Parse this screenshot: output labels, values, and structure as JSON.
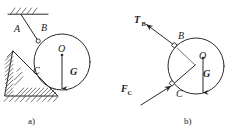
{
  "figure": {
    "stroke_color": "#2a2a2a",
    "hatch_color": "#3a3a3a",
    "background": "#ffffff"
  },
  "panel_a": {
    "caption": "a)",
    "labels": {
      "rod": "A",
      "pin_top": "B",
      "center": "O",
      "contact": "C",
      "weight": "G"
    },
    "geometry": {
      "circle_center_x": 62,
      "circle_center_y": 62,
      "circle_radius": 28,
      "pin_b_x": 38,
      "pin_b_y": 41,
      "ceiling_y": 14,
      "ceiling_x1": 8,
      "ceiling_x2": 48,
      "rod_top_x": 21,
      "rod_top_y": 14,
      "triangle_apex_x": 13,
      "triangle_apex_y": 51,
      "triangle_base_y": 96,
      "triangle_base_x1": 5,
      "triangle_base_x2": 58,
      "weight_arrow_x": 62,
      "weight_arrow_y1": 54,
      "weight_arrow_y2": 90
    }
  },
  "panel_b": {
    "caption": "b)",
    "labels": {
      "tension": "T",
      "tension_sub": "B",
      "pin_top": "B",
      "center": "O",
      "contact": "C",
      "weight": "G",
      "reaction": "F",
      "reaction_sub": "C"
    },
    "geometry": {
      "circle_center_x": 196,
      "circle_center_y": 66,
      "circle_radius": 28,
      "pin_b_x": 175,
      "pin_b_y": 46,
      "pin_c_x": 173,
      "pin_c_y": 84,
      "tension_tip_x": 144,
      "tension_tip_y": 22,
      "reaction_tail_x": 140,
      "reaction_tail_y": 106,
      "weight_arrow_x": 203,
      "weight_arrow_y1": 58,
      "weight_arrow_y2": 94
    }
  }
}
